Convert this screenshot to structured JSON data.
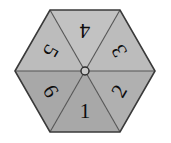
{
  "figure": {
    "name": "hexagonal-spinner",
    "shape": "hexagon",
    "sector_count": 6,
    "background_color": "#ffffff",
    "outline_color": "#3a3a3a",
    "divider_color": "#555555",
    "hub": {
      "label": "center-hub",
      "fill": "#c9c9c9",
      "stroke": "#2b2b2b"
    },
    "geometry": {
      "center_x": 85,
      "center_y": 71,
      "radius": 70,
      "vertices": [
        [
          15,
          71
        ],
        [
          50,
          10
        ],
        [
          120,
          10
        ],
        [
          155,
          71
        ],
        [
          120,
          132
        ],
        [
          50,
          132
        ]
      ]
    },
    "sectors": [
      {
        "label": "1",
        "position": "bottom",
        "fill": "#a8a8a8",
        "text_x": 85,
        "text_y": 111,
        "rotation": 0,
        "wedge": "85,71 120,132 50,132"
      },
      {
        "label": "2",
        "position": "bottom-right",
        "fill": "#b0b0b0",
        "text_x": 119,
        "text_y": 91,
        "rotation": -60,
        "wedge": "85,71 155,71 120,132"
      },
      {
        "label": "3",
        "position": "top-right",
        "fill": "#bcbcbc",
        "text_x": 119,
        "text_y": 51,
        "rotation": -120,
        "wedge": "85,71 120,10 155,71"
      },
      {
        "label": "4",
        "position": "top",
        "fill": "#c2c2c2",
        "text_x": 85,
        "text_y": 31,
        "rotation": 180,
        "wedge": "85,71 50,10 120,10"
      },
      {
        "label": "5",
        "position": "top-left",
        "fill": "#bcbcbc",
        "text_x": 51,
        "text_y": 51,
        "rotation": 120,
        "wedge": "85,71 15,71 50,10"
      },
      {
        "label": "6",
        "position": "bottom-left",
        "fill": "#a8a8a8",
        "text_x": 51,
        "text_y": 91,
        "rotation": 60,
        "wedge": "85,71 50,132 15,71"
      }
    ]
  }
}
